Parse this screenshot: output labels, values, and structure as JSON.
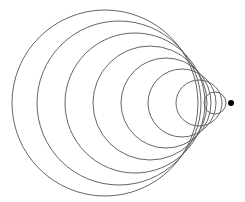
{
  "diagram": {
    "title": "",
    "background": "#ffffff",
    "stroke_color": "#555555",
    "stroke_width": 0.9,
    "circles": [
      {
        "cx": 105,
        "cy": 103,
        "r": 93
      },
      {
        "cx": 119,
        "cy": 103,
        "r": 82
      },
      {
        "cx": 135,
        "cy": 103,
        "r": 70
      },
      {
        "cx": 150,
        "cy": 103,
        "r": 57
      },
      {
        "cx": 166,
        "cy": 103,
        "r": 45
      },
      {
        "cx": 182,
        "cy": 103,
        "r": 34
      },
      {
        "cx": 199,
        "cy": 103,
        "r": 23
      },
      {
        "cx": 215,
        "cy": 103,
        "r": 11
      }
    ],
    "source_point": {
      "cx": 231,
      "cy": 103,
      "r": 3,
      "color": "#000000"
    }
  }
}
